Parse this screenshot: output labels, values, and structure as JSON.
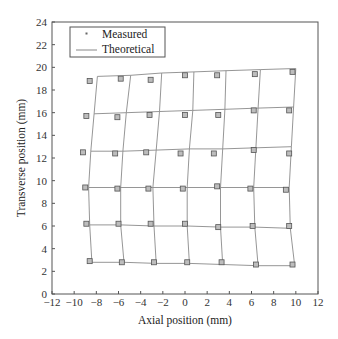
{
  "chart_data": {
    "type": "scatter",
    "title": "",
    "xlabel": "Axial position (mm)",
    "ylabel": "Transverse position (mm)",
    "xlim": [
      -12,
      12
    ],
    "ylim": [
      0,
      24
    ],
    "xticks": [
      -12,
      -10,
      -8,
      -6,
      -4,
      -2,
      0,
      2,
      4,
      6,
      8,
      10,
      12
    ],
    "yticks": [
      0,
      2,
      4,
      6,
      8,
      10,
      12,
      14,
      16,
      18,
      20,
      22,
      24
    ],
    "grid": false,
    "legend": {
      "position": "upper left",
      "entries": [
        "Measured",
        "Theoretical"
      ]
    },
    "series": [
      {
        "name": "Theoretical",
        "style": "line-grid",
        "rows": [
          [
            [
              -7.9,
              19.2
            ],
            [
              -4.9,
              19.3
            ],
            [
              -2.1,
              19.5
            ],
            [
              0.8,
              19.6
            ],
            [
              3.7,
              19.7
            ],
            [
              6.8,
              19.8
            ],
            [
              10.0,
              19.9
            ]
          ],
          [
            [
              -8.2,
              15.9
            ],
            [
              -5.3,
              16.0
            ],
            [
              -2.3,
              16.1
            ],
            [
              0.7,
              16.2
            ],
            [
              3.6,
              16.3
            ],
            [
              6.6,
              16.4
            ],
            [
              9.8,
              16.5
            ]
          ],
          [
            [
              -8.5,
              12.6
            ],
            [
              -5.6,
              12.6
            ],
            [
              -2.6,
              12.7
            ],
            [
              0.4,
              12.8
            ],
            [
              3.4,
              12.8
            ],
            [
              6.4,
              12.9
            ],
            [
              9.6,
              13.0
            ]
          ],
          [
            [
              -8.7,
              9.4
            ],
            [
              -5.8,
              9.4
            ],
            [
              -2.9,
              9.4
            ],
            [
              0.2,
              9.4
            ],
            [
              3.2,
              9.4
            ],
            [
              6.2,
              9.4
            ],
            [
              9.4,
              9.4
            ]
          ],
          [
            [
              -8.6,
              6.1
            ],
            [
              -5.8,
              6.1
            ],
            [
              -2.8,
              6.0
            ],
            [
              0.2,
              6.0
            ],
            [
              3.2,
              5.9
            ],
            [
              6.3,
              5.9
            ],
            [
              9.5,
              5.8
            ]
          ],
          [
            [
              -8.4,
              2.8
            ],
            [
              -5.5,
              2.8
            ],
            [
              -2.6,
              2.7
            ],
            [
              0.4,
              2.7
            ],
            [
              3.4,
              2.6
            ],
            [
              6.6,
              2.5
            ],
            [
              9.9,
              2.5
            ]
          ]
        ]
      },
      {
        "name": "Measured",
        "style": "square-marker",
        "points": [
          [
            -8.6,
            18.8
          ],
          [
            -5.8,
            19.0
          ],
          [
            -3.1,
            18.9
          ],
          [
            0.0,
            19.3
          ],
          [
            2.9,
            19.3
          ],
          [
            6.3,
            19.4
          ],
          [
            9.7,
            19.6
          ],
          [
            -8.9,
            15.7
          ],
          [
            -6.1,
            15.6
          ],
          [
            -3.2,
            15.8
          ],
          [
            0.0,
            15.8
          ],
          [
            3.0,
            15.8
          ],
          [
            6.2,
            16.2
          ],
          [
            9.4,
            16.2
          ],
          [
            -9.2,
            12.5
          ],
          [
            -6.3,
            12.4
          ],
          [
            -3.5,
            12.5
          ],
          [
            -0.4,
            12.4
          ],
          [
            2.6,
            12.4
          ],
          [
            6.2,
            12.7
          ],
          [
            9.4,
            12.4
          ],
          [
            -9.0,
            9.4
          ],
          [
            -6.1,
            9.3
          ],
          [
            -3.3,
            9.3
          ],
          [
            -0.2,
            9.3
          ],
          [
            2.9,
            9.5
          ],
          [
            5.9,
            9.3
          ],
          [
            9.1,
            9.2
          ],
          [
            -8.9,
            6.2
          ],
          [
            -6.0,
            6.2
          ],
          [
            -3.1,
            6.2
          ],
          [
            0.0,
            6.2
          ],
          [
            3.0,
            5.9
          ],
          [
            6.1,
            6.0
          ],
          [
            9.4,
            6.0
          ],
          [
            -8.6,
            2.9
          ],
          [
            -5.7,
            2.8
          ],
          [
            -2.8,
            2.8
          ],
          [
            0.2,
            2.8
          ],
          [
            3.3,
            2.8
          ],
          [
            6.4,
            2.6
          ],
          [
            9.7,
            2.6
          ]
        ]
      }
    ]
  },
  "legend": {
    "measured_label": "Measured",
    "theoretical_label": "Theoretical"
  },
  "axes": {
    "xlabel": "Axial position (mm)",
    "ylabel": "Transverse position (mm)"
  }
}
